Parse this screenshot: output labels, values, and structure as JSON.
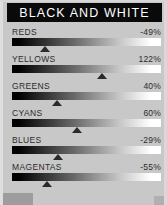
{
  "panel": {
    "background_color": "#c8c8c8",
    "width": 167,
    "height": 205
  },
  "header": {
    "title": "BLACK AND WHITE",
    "background_color": "#0a0a0a",
    "text_color": "#ffffff"
  },
  "sliders": {
    "track_start_color": "#000000",
    "track_end_color": "#ffffff",
    "thumb_color": "#2a2a2a",
    "rows": [
      {
        "label": "REDS",
        "value": "-49%",
        "thumb_left": "42px"
      },
      {
        "label": "YELLOWS",
        "value": "122%",
        "thumb_left": "99px"
      },
      {
        "label": "GREENS",
        "value": "40%",
        "thumb_left": "54px"
      },
      {
        "label": "CYANS",
        "value": "60%",
        "thumb_left": "74px"
      },
      {
        "label": "BLUES",
        "value": "-29%",
        "thumb_left": "55px"
      },
      {
        "label": "MAGENTAS",
        "value": "-55%",
        "thumb_left": "44px"
      }
    ]
  }
}
